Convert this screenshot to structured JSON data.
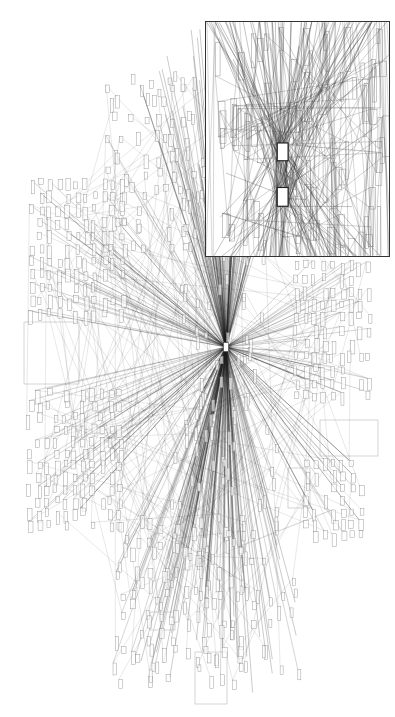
{
  "figure": {
    "type": "network-graph",
    "background": "#ffffff",
    "edge_color": "#222222",
    "node_stroke": "#888888",
    "labels_visible": false
  },
  "main_graph": {
    "width": 395,
    "height": 717,
    "hub": {
      "x": 226,
      "y": 347,
      "w": 5,
      "h": 9,
      "fill": "#ffffff",
      "stroke": "#444444"
    },
    "hub_edges": 260,
    "cross_edges": 180,
    "seed": 7,
    "clusters": [
      {
        "name": "left-upper-grid",
        "x": 30,
        "y": 180,
        "cols": 11,
        "rows": 11,
        "dx": 9,
        "dy": 13,
        "jitter": 2
      },
      {
        "name": "left-lower-grid",
        "x": 28,
        "y": 390,
        "cols": 11,
        "rows": 12,
        "dx": 9,
        "dy": 12,
        "jitter": 2
      },
      {
        "name": "right-upper-grid",
        "x": 295,
        "y": 262,
        "cols": 9,
        "rows": 11,
        "dx": 9,
        "dy": 13,
        "jitter": 2
      },
      {
        "name": "right-lower-grid",
        "x": 305,
        "y": 460,
        "cols": 7,
        "rows": 7,
        "dx": 9,
        "dy": 12,
        "jitter": 2
      },
      {
        "name": "top-scatter",
        "x": 110,
        "y": 80,
        "cols": 8,
        "rows": 10,
        "dx": 11,
        "dy": 18,
        "jitter": 6
      },
      {
        "name": "bottom-scatter",
        "x": 120,
        "y": 520,
        "cols": 10,
        "rows": 12,
        "dx": 14,
        "dy": 14,
        "jitter": 7
      }
    ],
    "group_boxes": [
      {
        "x": 24,
        "y": 322,
        "w": 55,
        "h": 62
      },
      {
        "x": 320,
        "y": 420,
        "w": 58,
        "h": 36
      },
      {
        "x": 195,
        "y": 652,
        "w": 32,
        "h": 52
      },
      {
        "x": 288,
        "y": 468,
        "w": 22,
        "h": 40
      },
      {
        "x": 150,
        "y": 612,
        "w": 25,
        "h": 18
      }
    ]
  },
  "inset": {
    "x": 205,
    "y": 21,
    "w": 185,
    "h": 236,
    "border_color": "#333333",
    "hubs": [
      {
        "x": 72,
        "y": 122,
        "w": 11,
        "h": 18
      },
      {
        "x": 72,
        "y": 167,
        "w": 11,
        "h": 19
      }
    ],
    "hub_edges": 70,
    "cross_edges": 90,
    "node_count": 90,
    "seed": 13
  }
}
